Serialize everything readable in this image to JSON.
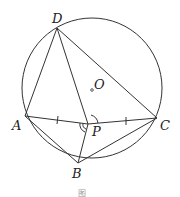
{
  "diagram": {
    "type": "geometry",
    "stroke_color": "#333333",
    "circle": {
      "center_label": "O",
      "cx": 92,
      "cy": 88,
      "r": 70
    },
    "points": {
      "A": {
        "x": 25,
        "y": 116,
        "label": "A"
      },
      "B": {
        "x": 78,
        "y": 163,
        "label": "B"
      },
      "C": {
        "x": 157,
        "y": 118,
        "label": "C"
      },
      "D": {
        "x": 57,
        "y": 28,
        "label": "D"
      },
      "P": {
        "x": 88,
        "y": 124,
        "label": "P"
      },
      "O": {
        "x": 92,
        "y": 90,
        "label": "O"
      }
    },
    "segments": [
      "DA",
      "DP",
      "DC",
      "AP",
      "PC",
      "AB",
      "PB",
      "BC"
    ],
    "tick_marks": [
      "AP",
      "PC"
    ],
    "angle_marks": [
      {
        "vertex": "P",
        "between": [
          "D",
          "C"
        ],
        "style": "single-arc"
      },
      {
        "vertex": "P",
        "between": [
          "A",
          "B"
        ],
        "style": "double-arc"
      }
    ],
    "caption": "图"
  }
}
